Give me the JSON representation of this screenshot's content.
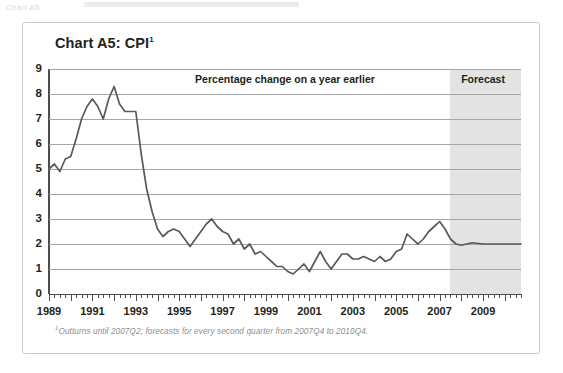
{
  "page": {
    "top_fragment": "Chart A5"
  },
  "chart_panel": {
    "title_main": "Chart A5: CPI",
    "title_footnote_marker": "1",
    "inchart_label": "Percentage change on a year earlier",
    "forecast_label": "Forecast",
    "footnote_marker": "1",
    "footnote_text": "Outturns until 2007Q2; forecasts for every second quarter from 2007Q4 to 2010Q4.",
    "colors": {
      "line": "#58595b",
      "gridline": "#a7a7a7",
      "axis": "#4d4d4d",
      "forecast_band": "#e3e3e3",
      "frame_border": "#c9c9c9",
      "text": "#231f20",
      "footnote_text": "#8d8d8d"
    }
  },
  "chart_data": {
    "type": "line",
    "title": "Chart A5: CPI",
    "subtitle": "Percentage change on a year earlier",
    "xlabel": "",
    "ylabel": "",
    "ylim": [
      0,
      9
    ],
    "xlim": [
      1989.0,
      2010.75
    ],
    "grid": true,
    "legend_position": "none",
    "y_ticks": [
      0,
      1,
      2,
      3,
      4,
      5,
      6,
      7,
      8,
      9
    ],
    "y_tick_labels": [
      "0",
      "1",
      "2",
      "3",
      "4",
      "5",
      "6",
      "7",
      "8",
      "9"
    ],
    "x_tick_labels": [
      "1989",
      "1991",
      "1993",
      "1995",
      "1997",
      "1999",
      "2001",
      "2003",
      "2005",
      "2007",
      "2009"
    ],
    "x_tick_values": [
      1989,
      1991,
      1993,
      1995,
      1997,
      1999,
      2001,
      2003,
      2005,
      2007,
      2009
    ],
    "x_minor_tick_step": 0.25,
    "annotations": [
      {
        "text": "Percentage change on a year earlier",
        "position": "top-center"
      },
      {
        "text": "Forecast",
        "position": "top-right",
        "x": 2009.0
      }
    ],
    "shaded_regions": [
      {
        "label": "Forecast",
        "x_start": 2007.5,
        "x_end": 2010.75,
        "color": "#e3e3e3"
      }
    ],
    "series": [
      {
        "name": "CPI",
        "color": "#58595b",
        "x": [
          1989.0,
          1989.25,
          1989.5,
          1989.75,
          1990.0,
          1990.25,
          1990.5,
          1990.75,
          1991.0,
          1991.25,
          1991.5,
          1991.75,
          1992.0,
          1992.25,
          1992.5,
          1992.75,
          1993.0,
          1993.25,
          1993.5,
          1993.75,
          1994.0,
          1994.25,
          1994.5,
          1994.75,
          1995.0,
          1995.25,
          1995.5,
          1995.75,
          1996.0,
          1996.25,
          1996.5,
          1996.75,
          1997.0,
          1997.25,
          1997.5,
          1997.75,
          1998.0,
          1998.25,
          1998.5,
          1998.75,
          1999.0,
          1999.25,
          1999.5,
          1999.75,
          2000.0,
          2000.25,
          2000.5,
          2000.75,
          2001.0,
          2001.25,
          2001.5,
          2001.75,
          2002.0,
          2002.25,
          2002.5,
          2002.75,
          2003.0,
          2003.25,
          2003.5,
          2003.75,
          2004.0,
          2004.25,
          2004.5,
          2004.75,
          2005.0,
          2005.25,
          2005.5,
          2005.75,
          2006.0,
          2006.25,
          2006.5,
          2006.75,
          2007.0,
          2007.25,
          2007.5,
          2007.75,
          2008.0,
          2008.5,
          2009.0,
          2009.5,
          2010.0,
          2010.5,
          2010.75
        ],
        "values": [
          5.0,
          5.2,
          4.9,
          5.4,
          5.5,
          6.2,
          7.0,
          7.5,
          7.8,
          7.5,
          7.0,
          7.8,
          8.3,
          7.6,
          7.3,
          7.3,
          7.3,
          5.6,
          4.2,
          3.3,
          2.6,
          2.3,
          2.5,
          2.6,
          2.5,
          2.2,
          1.9,
          2.2,
          2.5,
          2.8,
          3.0,
          2.7,
          2.5,
          2.4,
          2.0,
          2.2,
          1.8,
          2.0,
          1.6,
          1.7,
          1.5,
          1.3,
          1.1,
          1.1,
          0.9,
          0.8,
          1.0,
          1.2,
          0.9,
          1.3,
          1.7,
          1.3,
          1.0,
          1.3,
          1.6,
          1.6,
          1.4,
          1.4,
          1.5,
          1.4,
          1.3,
          1.5,
          1.3,
          1.4,
          1.7,
          1.8,
          2.4,
          2.2,
          2.0,
          2.2,
          2.5,
          2.7,
          2.9,
          2.6,
          2.2,
          2.0,
          1.95,
          2.05,
          2.0,
          2.0,
          2.0,
          2.0,
          2.0
        ]
      }
    ]
  }
}
